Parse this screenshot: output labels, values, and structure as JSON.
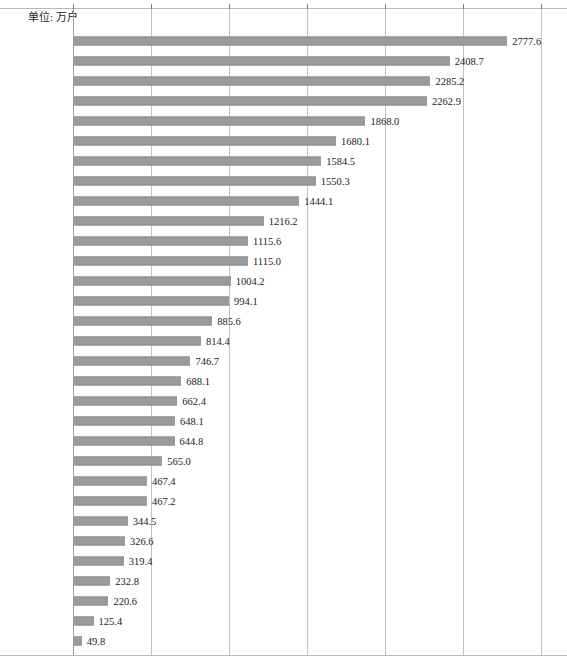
{
  "unit_caption": "单位: 万户",
  "colors": {
    "bar": "#9b9b9b",
    "bar_edge": "#8d8d8d",
    "gridline": "#c2c2c2",
    "axis": "#9d9d9d",
    "text": "#1b1b1b",
    "background": "#ffffff"
  },
  "chart_data": {
    "type": "bar",
    "orientation": "horizontal",
    "title": "",
    "subtitle": "",
    "xlabel": "",
    "ylabel": "",
    "unit": "万户",
    "xlim": [
      0.0,
      3000.0
    ],
    "xticks": [
      0.0,
      500.0,
      1000.0,
      1500.0,
      2000.0,
      2500.0,
      3000.0
    ],
    "xtick_labels": [
      "0.0",
      "500.0",
      "1000.0",
      "1500.0",
      "2000.0",
      "2500.0",
      "3000.0"
    ],
    "grid": true,
    "legend": false,
    "legend_position": "none",
    "data_labels": true,
    "categories": [
      "四川",
      "广东",
      "江苏",
      "山东",
      "河南",
      "河北",
      "安徽",
      "浙江",
      "湖南",
      "湖北",
      "江西",
      "福建",
      "广西",
      "陕西",
      "重庆",
      "云南",
      "新疆",
      "贵州",
      "山西",
      "辽宁",
      "甘肃",
      "上海",
      "内蒙古",
      "黑龙江",
      "天津",
      "北京",
      "吉林",
      "宁夏",
      "海南",
      "青海",
      "西藏"
    ],
    "values": [
      2777.6,
      2408.7,
      2285.2,
      2262.9,
      1868.0,
      1680.1,
      1584.5,
      1550.3,
      1444.1,
      1216.2,
      1115.6,
      1115.0,
      1004.2,
      994.1,
      885.6,
      814.4,
      746.7,
      688.1,
      662.4,
      648.1,
      644.8,
      565.0,
      467.4,
      467.2,
      344.5,
      326.6,
      319.4,
      232.8,
      220.6,
      125.4,
      49.8
    ],
    "value_labels": [
      "2777.6",
      "2408.7",
      "2285.2",
      "2262.9",
      "1868.0",
      "1680.1",
      "1584.5",
      "1550.3",
      "1444.1",
      "1216.2",
      "1115.6",
      "1115.0",
      "1004.2",
      "994.1",
      "885.6",
      "814.4",
      "746.7",
      "688.1",
      "662.4",
      "648.1",
      "644.8",
      "565.0",
      "467.4",
      "467.2",
      "344.5",
      "326.6",
      "319.4",
      "232.8",
      "220.6",
      "125.4",
      "49.8"
    ]
  }
}
